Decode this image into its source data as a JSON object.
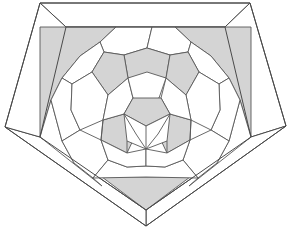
{
  "figure": {
    "title": "Truncated icosahedron inscribed in a pentagonal frame",
    "kind": "geometric-diagram",
    "width": 290,
    "height": 231,
    "background_color": "#ffffff",
    "colors": {
      "white_face": "#ffffff",
      "shaded_face": "#d4d4d4",
      "outline": "#585858",
      "frame_outline": "#4a4a4a",
      "frame_fill": "#ffffff"
    },
    "counts": {
      "visible_hexagons": 16,
      "visible_pentagons": 10,
      "frame_bevel_faces": 5,
      "frame_corner_wedges": 5
    },
    "outer_pentagon": [
      [
        40,
        3
      ],
      [
        250,
        3
      ],
      [
        286,
        126
      ],
      [
        146,
        226
      ],
      [
        5,
        127
      ]
    ],
    "inner_pentagon": [
      [
        66,
        27
      ],
      [
        225,
        27
      ],
      [
        251,
        137
      ],
      [
        146,
        210
      ],
      [
        40,
        137
      ]
    ],
    "frame_bevels": [
      {
        "name": "bevel-top",
        "points": "40,3 250,3 225,27 66,27"
      },
      {
        "name": "bevel-right",
        "points": "250,3 286,126 251,137 225,27"
      },
      {
        "name": "bevel-lower-right",
        "points": "286,126 146,226 146,210 251,137"
      },
      {
        "name": "bevel-lower-left",
        "points": "146,226 5,127 40,137 146,210"
      },
      {
        "name": "bevel-left",
        "points": "5,127 40,3 66,27 40,137"
      }
    ],
    "shaded_wedges": [
      {
        "name": "wedge-top-left",
        "points": "66,27 110,27 96,44 76,58 58,76 44,96 40,137 40,60"
      },
      {
        "name": "wedge-top-right",
        "points": "225,27 181,27 195,44 215,58 233,76 247,96 251,137 251,60"
      },
      {
        "name": "wedge-bottom",
        "points": "102,175 190,175 146,210"
      }
    ],
    "ball": {
      "center": [
        146,
        112
      ],
      "description": "Truncated icosahedron viewed down a 5-fold axis: central hexagon ring surrounded by alternating pentagons and hexagons"
    }
  }
}
